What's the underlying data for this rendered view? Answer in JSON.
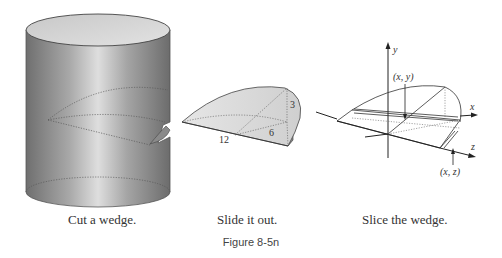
{
  "figure": {
    "label": "Figure 8-5n",
    "panels": [
      {
        "id": "cylinder",
        "caption": "Cut a wedge."
      },
      {
        "id": "wedge",
        "caption": "Slide it out.",
        "dimensions": {
          "length": "12",
          "radius": "6",
          "height": "3"
        }
      },
      {
        "id": "slice",
        "caption": "Slice the wedge.",
        "axes": {
          "x": "x",
          "y": "y",
          "z": "z"
        },
        "points": {
          "top": "(x, y)",
          "bottom": "(x, z)"
        }
      }
    ]
  },
  "colors": {
    "cylinder_dark": "#7a7a7a",
    "cylinder_light": "#d8d8d8",
    "wedge_fill": "#d6d6d6",
    "line": "#333333"
  }
}
